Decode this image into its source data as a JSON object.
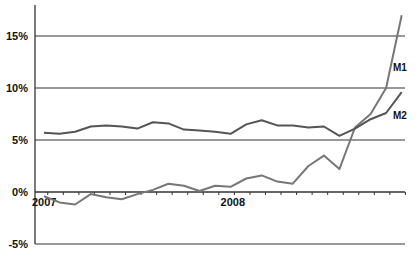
{
  "chart_data": {
    "type": "line",
    "title": "",
    "xlabel": "",
    "ylabel": "",
    "ylim": [
      -5,
      17
    ],
    "yticks": [
      -5,
      0,
      5,
      10,
      15
    ],
    "ytick_labels": [
      "-5%",
      "0%",
      "5%",
      "10%",
      "15%"
    ],
    "xtick_labels": [
      {
        "label": "2007",
        "index": 0
      },
      {
        "label": "2008",
        "index": 12
      }
    ],
    "grid": "horizontal",
    "x": [
      0,
      1,
      2,
      3,
      4,
      5,
      6,
      7,
      8,
      9,
      10,
      11,
      12,
      13,
      14,
      15,
      16,
      17,
      18,
      19,
      20,
      21,
      22,
      23
    ],
    "series": [
      {
        "name": "M1",
        "color": "#777777",
        "values": [
          -0.4,
          -1.0,
          -1.2,
          -0.2,
          -0.5,
          -0.7,
          -0.2,
          0.2,
          0.8,
          0.6,
          0.1,
          0.6,
          0.5,
          1.3,
          1.6,
          1.0,
          0.8,
          2.5,
          3.5,
          2.2,
          6.2,
          7.5,
          10.0,
          17.0
        ]
      },
      {
        "name": "M2",
        "color": "#555555",
        "values": [
          5.7,
          5.6,
          5.8,
          6.3,
          6.4,
          6.3,
          6.1,
          6.7,
          6.6,
          6.0,
          5.9,
          5.8,
          5.6,
          6.5,
          6.9,
          6.4,
          6.4,
          6.2,
          6.3,
          5.4,
          6.1,
          7.0,
          7.6,
          9.6
        ]
      }
    ],
    "annotations": [
      {
        "text": "M1",
        "near_series": "M1"
      },
      {
        "text": "M2",
        "near_series": "M2"
      }
    ],
    "legend": "none (inline labels)"
  }
}
